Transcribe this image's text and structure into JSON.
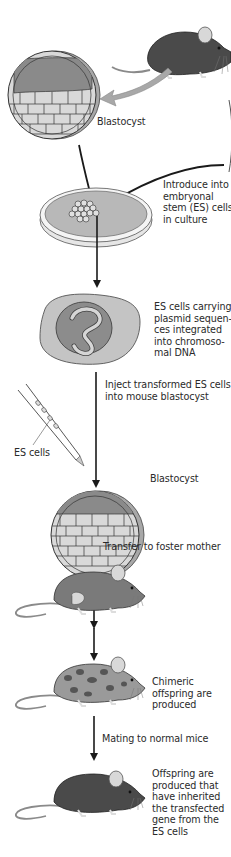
{
  "diagram": {
    "title": "",
    "colors": {
      "background": "#ffffff",
      "mouse_dark": "#4a4a4a",
      "mouse_medium": "#7a7a7a",
      "mouse_ear": "#d8d8d8",
      "blastocyst_cavity": "#8a8a8a",
      "blastocyst_cells": "#d9d9d9",
      "blastocyst_rim": "#a8a8a8",
      "dish_medium": "#b8b8b8",
      "cell_body": "#c4c4c4",
      "nucleus": "#8c8c8c",
      "plasmid_dna": "#d6d6d6",
      "arrow": "#1a1a1a",
      "big_arrow": "#a0a0a0",
      "text": "#2a2a2a"
    },
    "labels": {
      "blastocyst_top": "Blastocyst",
      "introduce": [
        "Introduce into",
        "embryonal",
        "stem (ES) cells",
        "in culture"
      ],
      "es_cells_carrying": [
        "ES cells carrying",
        "plasmid sequen-",
        "ces integrated",
        "into chromoso-",
        "mal DNA"
      ],
      "inject": [
        "Inject transformed ES cells",
        "into mouse blastocyst"
      ],
      "es_cells": "ES cells",
      "blastocyst_mid": "Blastocyst",
      "transfer": "Transfer to foster mother",
      "chimeric": [
        "Chimeric",
        "offspring are",
        "produced"
      ],
      "mating": "Mating to normal mice",
      "offspring": [
        "Offspring are",
        "produced that",
        "have inherited",
        "the transfected",
        "gene from the",
        "ES cells"
      ]
    },
    "steps": [
      {
        "id": "donor-mouse",
        "description": "Dark donor mouse"
      },
      {
        "id": "blastocyst-harvest",
        "description": "Blastocyst"
      },
      {
        "id": "es-culture",
        "description": "Petri dish with ES cells in culture"
      },
      {
        "id": "transformed-cell",
        "description": "ES cell with plasmid integrated into chromosomal DNA"
      },
      {
        "id": "injection",
        "description": "Injection pipette with ES cells into blastocyst"
      },
      {
        "id": "foster-mother",
        "description": "Foster mother mouse"
      },
      {
        "id": "chimeric-offspring",
        "description": "Spotted chimeric mouse"
      },
      {
        "id": "transgenic-offspring",
        "description": "Dark offspring mouse"
      }
    ]
  }
}
